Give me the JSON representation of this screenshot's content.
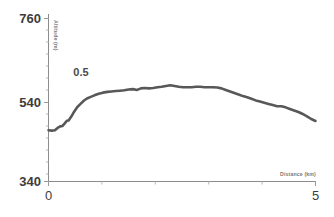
{
  "chart_data": {
    "type": "line",
    "title": "",
    "xlabel": "Distance (km)",
    "ylabel": "Altitude (m)",
    "xlim": [
      0,
      5
    ],
    "ylim": [
      340,
      760
    ],
    "xticks": [
      0,
      1,
      2,
      3,
      4,
      5
    ],
    "xtick_labels": [
      "0",
      "",
      "",
      "",
      "",
      "5"
    ],
    "yticks": [
      340,
      540,
      760
    ],
    "ytick_labels": [
      "340",
      "540",
      "760"
    ],
    "grid": false,
    "legend": null,
    "series_color": "#585858",
    "annotations": [
      {
        "text": "0.5",
        "x": 0.72,
        "y": 648
      }
    ],
    "series": [
      {
        "name": "Elevation profile",
        "x": [
          0.0,
          0.06,
          0.12,
          0.17,
          0.22,
          0.26,
          0.3,
          0.34,
          0.38,
          0.43,
          0.48,
          0.54,
          0.6,
          0.66,
          0.72,
          0.79,
          0.86,
          0.94,
          1.02,
          1.1,
          1.18,
          1.26,
          1.34,
          1.42,
          1.5,
          1.58,
          1.66,
          1.73,
          1.8,
          1.88,
          1.96,
          2.04,
          2.12,
          2.2,
          2.28,
          2.36,
          2.44,
          2.52,
          2.6,
          2.68,
          2.76,
          2.84,
          2.92,
          3.0,
          3.08,
          3.16,
          3.24,
          3.32,
          3.4,
          3.48,
          3.56,
          3.64,
          3.72,
          3.8,
          3.88,
          3.96,
          4.04,
          4.12,
          4.2,
          4.28,
          4.36,
          4.44,
          4.52,
          4.6,
          4.68,
          4.76,
          4.84,
          4.92,
          5.0
        ],
        "y": [
          472,
          471,
          472,
          478,
          482,
          483,
          489,
          496,
          498,
          508,
          520,
          532,
          540,
          548,
          554,
          558,
          562,
          566,
          569,
          571,
          572,
          573,
          574,
          575,
          577,
          578,
          576,
          580,
          581,
          580,
          581,
          583,
          584,
          586,
          588,
          586,
          584,
          583,
          583,
          583,
          584,
          584,
          583,
          583,
          583,
          582,
          580,
          576,
          572,
          568,
          564,
          560,
          557,
          553,
          549,
          546,
          543,
          540,
          537,
          534,
          534,
          531,
          527,
          523,
          519,
          514,
          508,
          501,
          496
        ]
      }
    ]
  },
  "axis": {
    "y_label_top": "760",
    "y_label_mid": "540",
    "y_label_bottom": "340",
    "x_label_left": "0",
    "x_label_right": "5",
    "x_title": "Distance (km)",
    "y_title": "Altitude (m)"
  },
  "annotation": {
    "label": "0.5"
  }
}
